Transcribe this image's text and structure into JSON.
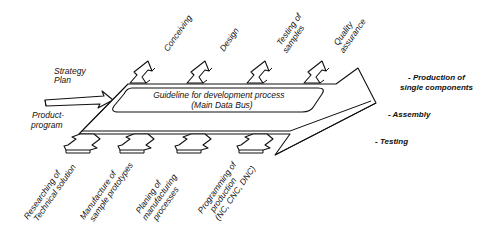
{
  "diagram": {
    "inputs": {
      "strategy_plan": [
        "Strategy",
        "Plan"
      ],
      "product_program": [
        "Product-",
        "program"
      ]
    },
    "main_bus": {
      "line1": "Guideline for development process",
      "line2": "(Main Data Bus)"
    },
    "upper_activities": [
      {
        "lines": [
          "Conceiving"
        ]
      },
      {
        "lines": [
          "Design"
        ]
      },
      {
        "lines": [
          "Testing of",
          "samples"
        ]
      },
      {
        "lines": [
          "Quality",
          "assurance"
        ]
      }
    ],
    "lower_activities": [
      {
        "lines": [
          "Researching of",
          "Technical solution"
        ]
      },
      {
        "lines": [
          "Manufacture of",
          "sample prototypes"
        ]
      },
      {
        "lines": [
          "Planing of",
          "manufacturing",
          "processes"
        ]
      },
      {
        "lines": [
          "Programming of",
          "production",
          "(NC, CNC, DNC)"
        ]
      }
    ],
    "outputs": [
      {
        "lines": [
          "- Production of",
          "single components"
        ]
      },
      {
        "lines": [
          "- Assembly"
        ]
      },
      {
        "lines": [
          "- Testing"
        ]
      }
    ]
  }
}
